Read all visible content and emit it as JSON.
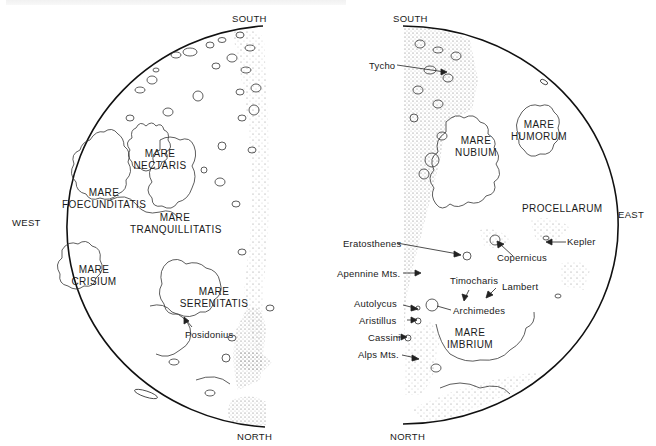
{
  "figure": {
    "caption_visible": false
  },
  "left_map": {
    "directions": {
      "south": "SOUTH",
      "north": "NORTH",
      "west": "WEST"
    },
    "maria": [
      {
        "line1": "MARE",
        "line2": "NECTARIS"
      },
      {
        "line1": "MARE",
        "line2": "FOECUNDITATIS"
      },
      {
        "line1": "MARE",
        "line2": "TRANQUILLITATIS"
      },
      {
        "line1": "MARE",
        "line2": "CRISIUM"
      },
      {
        "line1": "MARE",
        "line2": "SERENITATIS"
      }
    ],
    "features": [
      {
        "label": "Posidonius"
      }
    ]
  },
  "right_map": {
    "directions": {
      "south": "SOUTH",
      "north": "NORTH",
      "east": "EAST"
    },
    "maria": [
      {
        "line1": "MARE",
        "line2": "NUBIUM"
      },
      {
        "line1": "MARE",
        "line2": "HUMORUM"
      },
      {
        "line1": "PROCELLARUM",
        "line2": ""
      },
      {
        "line1": "MARE",
        "line2": "IMBRIUM"
      }
    ],
    "features": [
      {
        "label": "Tycho"
      },
      {
        "label": "Eratosthenes"
      },
      {
        "label": "Copernicus"
      },
      {
        "label": "Kepler"
      },
      {
        "label": "Apennine Mts."
      },
      {
        "label": "Timocharis"
      },
      {
        "label": "Lambert"
      },
      {
        "label": "Autolycus"
      },
      {
        "label": "Archimedes"
      },
      {
        "label": "Aristillus"
      },
      {
        "label": "Cassini"
      },
      {
        "label": "Alps Mts."
      }
    ]
  }
}
